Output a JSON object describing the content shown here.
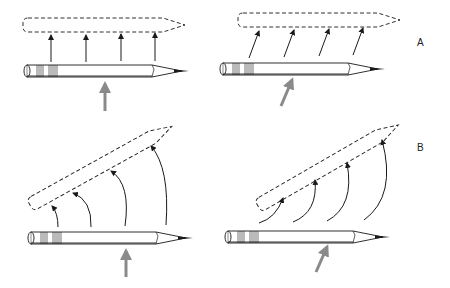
{
  "figure": {
    "rows": [
      {
        "label": "A",
        "description": "Translation: pencil moves straight to new position"
      },
      {
        "label": "B",
        "description": "Rotation: pencil rotates to new tilted position"
      }
    ],
    "colors": {
      "line": "#1a1a1a",
      "force_arrow": "#8a8a8a",
      "background": "#ffffff"
    }
  }
}
